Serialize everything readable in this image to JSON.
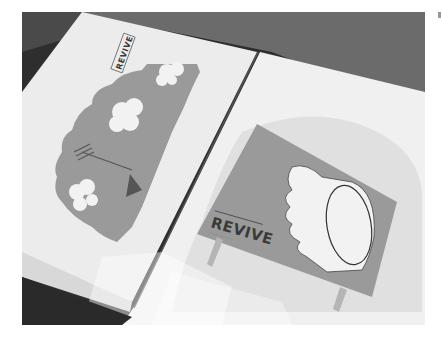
{
  "photo": {
    "subject": "open portfolio book on a dark surface",
    "left_page": {
      "illustration": "grey landscape with clouds and a tent/umbrella",
      "logo_text": "REVIVE"
    },
    "right_page": {
      "illustration": "billboard sign with a stylized leaf/cloud graphic",
      "logo_text": "REVIVE",
      "tagline_text": "········ ····· ·······"
    }
  },
  "colors": {
    "background_dark": "#2e2e2e",
    "surface_mid": "#6a6a6a",
    "page_white": "#f0f0f0",
    "illustration_grey": "#9a9a9a",
    "cloud_white": "#f2f2f2",
    "text_dark": "#3a3a3a"
  }
}
